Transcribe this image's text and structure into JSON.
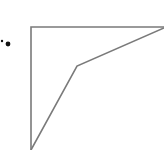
{
  "diagram": {
    "label_marker": "·●",
    "stroke_color": "#7a7a7a",
    "dot_color": "#111111",
    "frame": {
      "top_left": [
        31,
        27
      ],
      "top_right": [
        164,
        27
      ],
      "bottom_left": [
        31,
        150
      ]
    },
    "polyline": [
      [
        31,
        150
      ],
      [
        77,
        66
      ],
      [
        164,
        28
      ]
    ],
    "dots": [
      {
        "x": 2,
        "y": 41,
        "r": 1.2
      },
      {
        "x": 8,
        "y": 44,
        "r": 2.4
      }
    ]
  }
}
